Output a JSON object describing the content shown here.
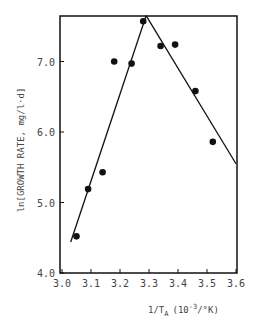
{
  "chart_data": {
    "type": "scatter",
    "title": "",
    "xlabel": "1/T_A (10^-3/°K)",
    "xlabel_main": "1/T",
    "xlabel_sub": "A",
    "xlabel_unit_prefix": "(10",
    "xlabel_unit_exp": "-3",
    "xlabel_unit_suffix": "/°K)",
    "ylabel": "ln[GROWTH RATE, mg/l·d]",
    "xlim": [
      3.0,
      3.6
    ],
    "ylim": [
      4.0,
      7.65
    ],
    "grid": false,
    "legend": null,
    "x_ticks": [
      "3.0",
      "3.1",
      "3.2",
      "3.3",
      "3.4",
      "3.5",
      "3.6"
    ],
    "y_ticks": [
      "4.0",
      "5.0",
      "6.0",
      "7.0"
    ],
    "series": [
      {
        "name": "observed",
        "kind": "scatter",
        "x": [
          3.05,
          3.09,
          3.14,
          3.18,
          3.24,
          3.28,
          3.34,
          3.39,
          3.46,
          3.52
        ],
        "y": [
          4.52,
          5.19,
          5.43,
          7.0,
          6.97,
          7.57,
          7.22,
          7.24,
          6.58,
          5.86
        ]
      },
      {
        "name": "fit-rising",
        "kind": "line",
        "x": [
          3.03,
          3.29
        ],
        "y": [
          4.44,
          7.65
        ]
      },
      {
        "name": "fit-falling",
        "kind": "line",
        "x": [
          3.29,
          3.6
        ],
        "y": [
          7.65,
          5.55
        ]
      }
    ]
  },
  "colors": {
    "ink": "#111111",
    "text": "#444444",
    "background": "#ffffff"
  }
}
